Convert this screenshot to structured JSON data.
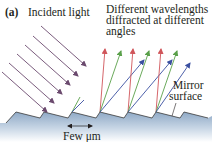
{
  "figure": {
    "panel_label": "(a)",
    "incident_label": "Incident light",
    "diffracted_label": {
      "line1": "Different wavelengths",
      "line2": "diffracted at different",
      "line3": "angles"
    },
    "mirror_label": {
      "line1": "Mirror",
      "line2": "surface"
    },
    "scale_label": "Few μm"
  },
  "colors": {
    "incident": "#6b4a6e",
    "red": "#d0555a",
    "green": "#5aa04a",
    "blue": "#3a4fa0",
    "surface_top": "#8fa9c6",
    "surface_bottom": "#ffffff",
    "outline": "#3a3a3a"
  }
}
